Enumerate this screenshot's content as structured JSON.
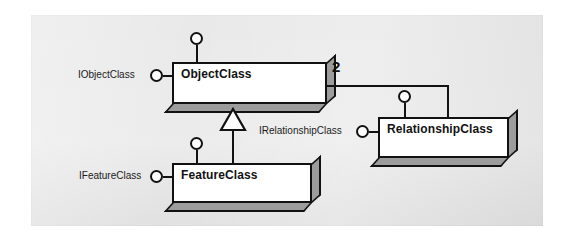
{
  "diagram": {
    "type": "uml-class-diagram",
    "background_color": "#e9e9e9",
    "page_color": "#ffffff",
    "box_fill": "#ffffff",
    "box_depth_color": "#9c9c9c",
    "line_color": "#121212"
  },
  "classes": [
    {
      "id": "object-class",
      "name": "ObjectClass",
      "interface": "IObjectClass",
      "x": 172,
      "y": 62,
      "w": 155,
      "h": 42
    },
    {
      "id": "relationship-class",
      "name": "RelationshipClass",
      "interface": "IRelationshipClass",
      "x": 378,
      "y": 117,
      "w": 131,
      "h": 41
    },
    {
      "id": "feature-class",
      "name": "FeatureClass",
      "interface": "IFeatureClass",
      "x": 172,
      "y": 163,
      "w": 140,
      "h": 40
    }
  ],
  "interfaces": [
    {
      "id": "iobjectclass",
      "label": "IObjectClass"
    },
    {
      "id": "irelationshipclass",
      "label": "IRelationshipClass"
    },
    {
      "id": "ifeatureclass",
      "label": "IFeatureClass"
    }
  ],
  "associations": [
    {
      "id": "objectclass-relationshipclass",
      "from": "ObjectClass",
      "to": "RelationshipClass",
      "multiplicity": "2",
      "multiplicity_end": "ObjectClass"
    }
  ],
  "generalizations": [
    {
      "id": "featureclass-inherits-objectclass",
      "child": "FeatureClass",
      "parent": "ObjectClass",
      "notation": "hollow-triangle"
    }
  ],
  "labels": {
    "multiplicity_two": "2"
  }
}
